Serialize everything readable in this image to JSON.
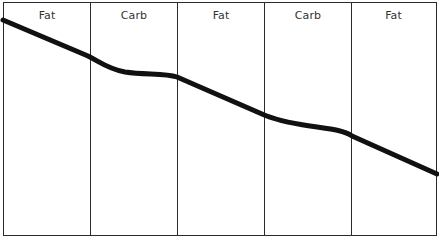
{
  "diagram": {
    "phases": [
      {
        "label": "Fat"
      },
      {
        "label": "Carb"
      },
      {
        "label": "Fat"
      },
      {
        "label": "Carb"
      },
      {
        "label": "Fat"
      }
    ],
    "curve": {
      "description": "Declining line that drops steeply in Fat phases and flattens in Carb phases",
      "color": "#111111",
      "points": [
        [
          3,
          20
        ],
        [
          90,
          57
        ],
        [
          177,
          76
        ],
        [
          264,
          115
        ],
        [
          351,
          135
        ],
        [
          437,
          174
        ]
      ]
    },
    "colors": {
      "border": "#2a2a2a",
      "background": "#ffffff",
      "text": "#333333"
    }
  }
}
